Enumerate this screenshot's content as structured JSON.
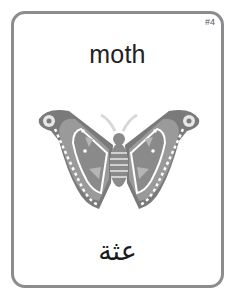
{
  "card": {
    "number": "#4",
    "word_english": "moth",
    "word_arabic": "عثة",
    "illustration": "moth-icon",
    "border_color": "#8c8c8c"
  }
}
